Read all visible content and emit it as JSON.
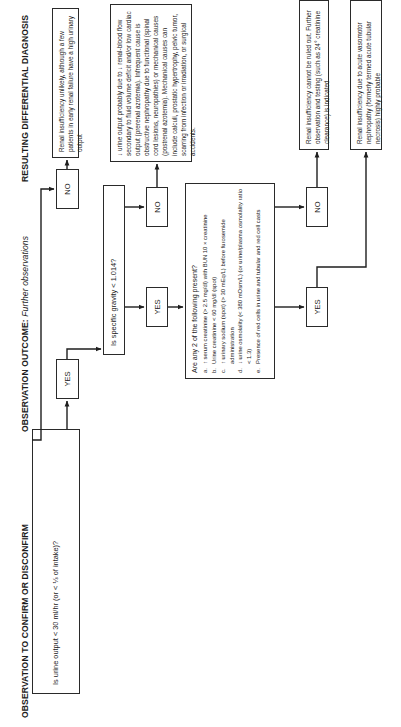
{
  "headers": {
    "observation": "OBSERVATION TO CONFIRM OR DISCONFIRM",
    "outcome_label": "OBSERVATION OUTCOME:",
    "outcome_sub": "Further observations",
    "diagnosis": "RESULTING DIFFERENTIAL DIAGNOSIS"
  },
  "questions": {
    "q1": "Is urine output < 30 ml/hr (or < ⅓ of intake)?",
    "q2": "Is specific gravity < 1.014?",
    "q3": {
      "title": "Are any 2 of the following present?",
      "items": [
        {
          "letter": "a.",
          "text": "↑ serum creatinine (> 2.5 mg/dl) with BUN 10 × creatinine"
        },
        {
          "letter": "b.",
          "text": "Urine creatinine < 60 mg/dl (spot)"
        },
        {
          "letter": "c.",
          "text": "↑ urinary sodium (spot) (> 30 mEq/L) before furosemide administration"
        },
        {
          "letter": "d.",
          "text": "↓ urine osmolality (< 380 mOsm/L) (or urine/plasma osmolality ratio < 1.3)"
        },
        {
          "letter": "e.",
          "text": "Presence of red cells in urine and tubular and red cell casts"
        }
      ]
    }
  },
  "answers": {
    "q1_no": "NO",
    "q1_yes": "YES",
    "q2_no": "NO",
    "q2_yes": "YES",
    "q3_no": "NO",
    "q3_yes": "YES"
  },
  "diagnoses": {
    "d1": "Renal insufficiency unlikely, although a few patients in early renal failure have a high urinary output",
    "d2": "↓ urine output probably due to ↓ renal-blood flow secondary to fluid volume deficit and/or low cardiac output (prerenal azotemia). Infrequent cause is obstructive nephropathy due to functional (spinal cord lesions, neuropathies) or mechanical causes (postrenal azotemia). Mechanical causes can include calculi, prostatic hypertrophy, pelvic tumor, scarring from infection or irradiation, or surgical accidents.",
    "d3": "Renal insufficiency cannot be ruled out. Further observation and testing (such as 24° creatinine clearance) is indicated",
    "d4": "Renal insufficiency due to acute vasomotor nephropathy (formerly termed acute tubular necrosis) highly probable"
  },
  "colors": {
    "line": "#1e1e1e",
    "border": "#2a2a2a",
    "background": "#ffffff"
  }
}
